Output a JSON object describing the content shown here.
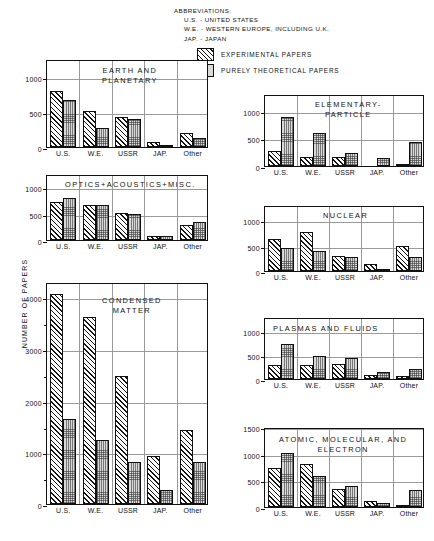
{
  "header": {
    "abbrev_title": "ABBREVIATIONS:",
    "abbrev_lines": [
      "U.S. - UNITED STATES",
      "W.E. - WESTERN EUROPE, INCLUDING U.K.",
      "JAP. - JAPAN"
    ],
    "legend": [
      {
        "key": "experimental",
        "label": "EXPERIMENTAL  PAPERS",
        "swatch": "hatched-diagonal"
      },
      {
        "key": "theoretical",
        "label": "PURELY THEORETICAL PAPERS",
        "swatch": "stippled-gray"
      }
    ]
  },
  "axis": {
    "y_title": "NUMBER OF PAPERS",
    "categories": [
      "U.S.",
      "W.E.",
      "USSR",
      "JAP.",
      "Other"
    ]
  },
  "chart_data": [
    {
      "id": "earth-and-planetary",
      "type": "bar",
      "title": "EARTH  AND\nPLANETARY",
      "xlabel": "",
      "ylabel": "NUMBER OF PAPERS",
      "ylim": [
        0,
        1250
      ],
      "yticks": [
        0,
        500,
        1000
      ],
      "ytick_labels": [
        "0",
        "500",
        "1000"
      ],
      "grid": true,
      "categories": [
        "U.S.",
        "W.E.",
        "USSR",
        "JAP.",
        "Other"
      ],
      "series": [
        {
          "name": "EXPERIMENTAL  PAPERS",
          "values": [
            790,
            510,
            430,
            75,
            200
          ]
        },
        {
          "name": "PURELY THEORETICAL PAPERS",
          "values": [
            665,
            275,
            395,
            25,
            135
          ]
        }
      ]
    },
    {
      "id": "optics-acoustics-misc",
      "type": "bar",
      "title": "OPTICS+ACOUSTICS+MISC.",
      "xlabel": "",
      "ylabel": "NUMBER OF PAPERS",
      "ylim": [
        0,
        1250
      ],
      "yticks": [
        0,
        500,
        1000
      ],
      "ytick_labels": [
        "0",
        "500",
        "1000"
      ],
      "grid": true,
      "categories": [
        "U.S.",
        "W.E.",
        "USSR",
        "JAP.",
        "Other"
      ],
      "series": [
        {
          "name": "EXPERIMENTAL  PAPERS",
          "values": [
            715,
            670,
            510,
            80,
            275
          ]
        },
        {
          "name": "PURELY THEORETICAL PAPERS",
          "values": [
            790,
            665,
            495,
            80,
            340
          ]
        }
      ]
    },
    {
      "id": "condensed-matter",
      "type": "bar",
      "title": "CONDENSED\nMATTER",
      "xlabel": "",
      "ylabel": "NUMBER OF PAPERS",
      "ylim": [
        0,
        4300
      ],
      "yticks": [
        0,
        1000,
        2000,
        3000,
        4000
      ],
      "ytick_labels": [
        "0",
        "1000",
        "2000",
        "3000",
        "4000"
      ],
      "minor_yticks": [
        500,
        1500,
        2500,
        3500
      ],
      "grid": true,
      "categories": [
        "U.S.",
        "W.E.",
        "USSR",
        "JAP.",
        "Other"
      ],
      "series": [
        {
          "name": "EXPERIMENTAL  PAPERS",
          "values": [
            4075,
            3620,
            2480,
            925,
            1430
          ]
        },
        {
          "name": "PURELY THEORETICAL PAPERS",
          "values": [
            1650,
            1240,
            810,
            270,
            805
          ]
        }
      ]
    },
    {
      "id": "elementary-particle",
      "type": "bar",
      "title": "ELEMENTARY-\nPARTICLE",
      "xlabel": "",
      "ylabel": "NUMBER OF PAPERS",
      "ylim": [
        0,
        1300
      ],
      "yticks": [
        0,
        500,
        1000
      ],
      "ytick_labels": [
        "0",
        "500",
        "1000"
      ],
      "grid": true,
      "categories": [
        "U.S.",
        "W.E.",
        "USSR",
        "JAP.",
        "Other"
      ],
      "series": [
        {
          "name": "EXPERIMENTAL  PAPERS",
          "values": [
            275,
            170,
            155,
            0,
            30
          ]
        },
        {
          "name": "PURELY THEORETICAL PAPERS",
          "values": [
            880,
            590,
            235,
            140,
            430
          ]
        }
      ]
    },
    {
      "id": "nuclear",
      "type": "bar",
      "title": "NUCLEAR",
      "xlabel": "",
      "ylabel": "NUMBER OF PAPERS",
      "ylim": [
        0,
        1300
      ],
      "yticks": [
        0,
        500,
        1000
      ],
      "ytick_labels": [
        "0",
        "500",
        "1000"
      ],
      "grid": true,
      "categories": [
        "U.S.",
        "W.E.",
        "USSR",
        "JAP.",
        "Other"
      ],
      "series": [
        {
          "name": "EXPERIMENTAL  PAPERS",
          "values": [
            630,
            775,
            290,
            140,
            495
          ]
        },
        {
          "name": "PURELY THEORETICAL PAPERS",
          "values": [
            450,
            390,
            270,
            40,
            285
          ]
        }
      ]
    },
    {
      "id": "plasmas-and-fluids",
      "type": "bar",
      "title": "PLASMAS  AND  FLUIDS",
      "xlabel": "",
      "ylabel": "NUMBER OF PAPERS",
      "ylim": [
        0,
        1300
      ],
      "yticks": [
        0,
        500,
        1000
      ],
      "ytick_labels": [
        "0",
        "500",
        "1000"
      ],
      "grid": true,
      "categories": [
        "U.S.",
        "W.E.",
        "USSR",
        "JAP.",
        "Other"
      ],
      "series": [
        {
          "name": "EXPERIMENTAL  PAPERS",
          "values": [
            295,
            285,
            310,
            80,
            70
          ]
        },
        {
          "name": "PURELY THEORETICAL PAPERS",
          "values": [
            740,
            480,
            435,
            140,
            200
          ]
        }
      ]
    },
    {
      "id": "atomic-molecular-and-electron",
      "type": "bar",
      "title": "ATOMIC, MOLECULAR, AND\nELECTRON",
      "xlabel": "",
      "ylabel": "NUMBER OF PAPERS",
      "ylim": [
        0,
        1500
      ],
      "yticks": [
        0,
        500,
        1000,
        1500
      ],
      "ytick_labels": [
        "0",
        "500",
        "1000",
        "1500"
      ],
      "grid": true,
      "categories": [
        "U.S.",
        "W.E.",
        "USSR",
        "JAP.",
        "Other"
      ],
      "series": [
        {
          "name": "EXPERIMENTAL  PAPERS",
          "values": [
            730,
            815,
            340,
            105,
            40
          ]
        },
        {
          "name": "PURELY THEORETICAL PAPERS",
          "values": [
            1020,
            580,
            385,
            70,
            325
          ]
        }
      ]
    }
  ],
  "panel_layout": {
    "earth-and-planetary": {
      "left": 46,
      "top": 60,
      "width": 162,
      "height": 88,
      "title_left": 55,
      "title_top": 5
    },
    "optics-acoustics-misc": {
      "left": 46,
      "top": 175,
      "width": 162,
      "height": 66,
      "title_left": 18,
      "title_top": 4
    },
    "condensed-matter": {
      "left": 46,
      "top": 283,
      "width": 162,
      "height": 222,
      "title_left": 55,
      "title_top": 12
    },
    "elementary-particle": {
      "left": 264,
      "top": 95,
      "width": 160,
      "height": 72,
      "title_left": 50,
      "title_top": 4
    },
    "nuclear": {
      "left": 264,
      "top": 206,
      "width": 160,
      "height": 66,
      "title_left": 58,
      "title_top": 4
    },
    "plasmas-and-fluids": {
      "left": 264,
      "top": 318,
      "width": 160,
      "height": 62,
      "title_left": 8,
      "title_top": 5
    },
    "atomic-molecular-and-electron": {
      "left": 264,
      "top": 428,
      "width": 160,
      "height": 80,
      "title_left": 14,
      "title_top": 6
    }
  }
}
